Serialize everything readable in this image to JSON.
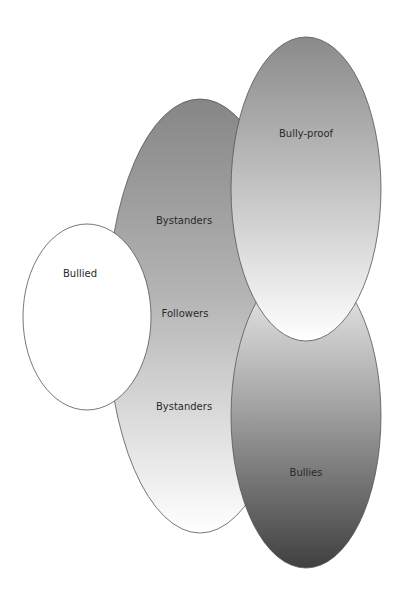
{
  "diagram": {
    "type": "overlapping-ellipses",
    "groups": [
      {
        "id": "followers",
        "labels": [
          "Bystanders",
          "Followers",
          "Bystanders"
        ],
        "fill": "gradient dark-gray top to white bottom"
      },
      {
        "id": "bullied",
        "label": "Bullied",
        "fill": "#ffffff"
      },
      {
        "id": "bullies",
        "label": "Bullies",
        "fill": "gradient light-gray top to dark-gray bottom"
      },
      {
        "id": "bully-proof",
        "label": "Bully-proof",
        "fill": "gradient gray top to white bottom"
      }
    ]
  },
  "labels": {
    "bystanders_top": "Bystanders",
    "followers": "Followers",
    "bystanders_bottom": "Bystanders",
    "bullied": "Bullied",
    "bully_proof": "Bully-proof",
    "bullies": "Bullies"
  },
  "colors": {
    "stroke": "#555555",
    "followers_top": "#868686",
    "followers_bottom": "#ffffff",
    "bullyproof_top": "#8a8a8a",
    "bullyproof_bottom": "#ffffff",
    "bullies_top": "#e6e6e6",
    "bullies_bottom": "#454545",
    "bullied_fill": "#ffffff"
  }
}
